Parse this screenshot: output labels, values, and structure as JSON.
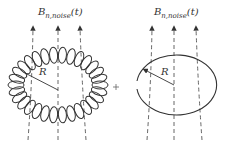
{
  "diagram": {
    "left_panel": {
      "title_main": "B",
      "title_sub": "n,noise",
      "title_arg": "(t)",
      "radius_label": "R",
      "shape": "toroidal-coil"
    },
    "operator": "+",
    "right_panel": {
      "title_main": "B",
      "title_sub": "n,noise",
      "title_arg": "(t)",
      "radius_label": "R",
      "shape": "single-loop"
    },
    "colors": {
      "stroke": "#333333",
      "dashed": "#555555",
      "background": "#ffffff"
    }
  }
}
